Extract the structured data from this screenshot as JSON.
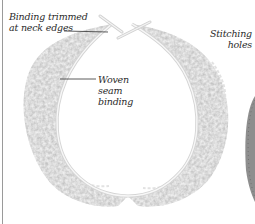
{
  "figure": {
    "colors": {
      "background": "#ffffff",
      "lace_light": "#f2f2f2",
      "lace_mid": "#d8d8d8",
      "lace_dark": "#b9b9b9",
      "binding": "#e6e6e6",
      "leader_line": "#333333",
      "text": "#2a2a2a",
      "side_panel": "#8a8a8a"
    }
  },
  "labels": {
    "binding_trimmed": "Binding trimmed\nat neck edges",
    "woven_seam": "Woven\nseam\nbinding",
    "stitching_holes": "Stitching\nholes"
  }
}
